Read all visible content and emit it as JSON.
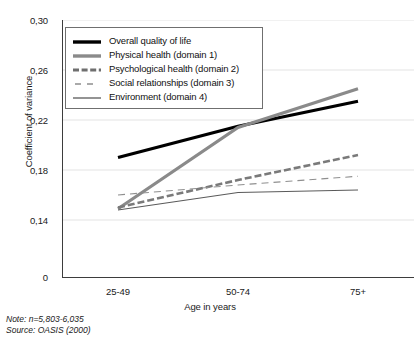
{
  "chart_data": {
    "type": "line",
    "title": "",
    "xlabel": "Age in years",
    "ylabel": "Coefficient of variance",
    "categories": [
      "25-49",
      "50-74",
      "75+"
    ],
    "x": [
      0,
      1,
      2
    ],
    "ylim": [
      0.12,
      0.3
    ],
    "yticks": [
      0.3,
      0.26,
      0.22,
      0.18,
      0.14,
      0
    ],
    "ytick_labels": [
      "0,30",
      "0,26",
      "0,22",
      "0,18",
      "0,14",
      "0"
    ],
    "grid": true,
    "grid_axis": "y",
    "legend_position": "upper left",
    "series": [
      {
        "name": "Overall quality of life",
        "values": [
          0.19,
          0.215,
          0.235
        ],
        "color": "#000000",
        "width": 3.2,
        "dash": "none"
      },
      {
        "name": "Physical health (domain 1)",
        "values": [
          0.149,
          0.214,
          0.245
        ],
        "color": "#8a8a8a",
        "width": 3.2,
        "dash": "none"
      },
      {
        "name": "Psychological health (domain 2)",
        "values": [
          0.15,
          0.172,
          0.192
        ],
        "color": "#7a7a7a",
        "width": 2.6,
        "dash": "7,3"
      },
      {
        "name": "Social relationships (domain 3)",
        "values": [
          0.16,
          0.168,
          0.175
        ],
        "color": "#8f8f8f",
        "width": 1.1,
        "dash": "7,5"
      },
      {
        "name": "Environment (domain 4)",
        "values": [
          0.148,
          0.162,
          0.164
        ],
        "color": "#5a5a5a",
        "width": 1.2,
        "dash": "none"
      }
    ]
  },
  "axes": {
    "y_title": "Coefficient of variance",
    "x_title": "Age in years",
    "y_tick_labels": [
      "0,30",
      "0,26",
      "0,22",
      "0,18",
      "0,14",
      "0"
    ],
    "x_tick_labels": [
      "25-49",
      "50-74",
      "75+"
    ]
  },
  "legend": {
    "items": [
      {
        "label": "Overall quality of life",
        "swatch": "thick-solid-black"
      },
      {
        "label": "Physical health (domain 1)",
        "swatch": "thick-solid-gray"
      },
      {
        "label": "Psychological health (domain 2)",
        "swatch": "thick-dashed-gray"
      },
      {
        "label": "Social relationships (domain 3)",
        "swatch": "thin-dashed-gray"
      },
      {
        "label": "Environment (domain 4)",
        "swatch": "thin-solid-gray"
      }
    ]
  },
  "footnotes": {
    "note": "Note: n=5,803-6,035",
    "source": "Source: OASIS (2000)"
  },
  "colors": {
    "axis": "#3d3d3d",
    "grid": "#e3e3e3",
    "text": "#1a1a1a",
    "legend_border": "#6f6f6f"
  }
}
